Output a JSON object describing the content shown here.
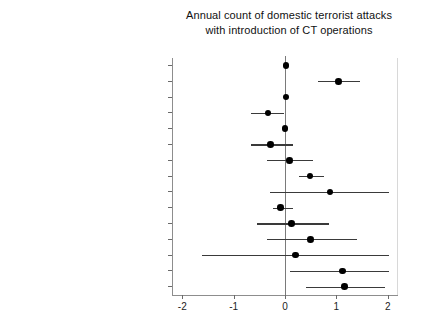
{
  "chart_data": {
    "type": "scatter",
    "title": "Annual count of domestic terrorist attacks with introduction of CT operations",
    "title_lines": [
      "Annual count of domestic terrorist attacks",
      "with introduction of CT operations"
    ],
    "subtitle": "",
    "xlabel": "",
    "ylabel": "",
    "xlim": [
      -2.2,
      2.2
    ],
    "xticks": [
      -2,
      -1,
      0,
      1,
      2
    ],
    "xtick_labels": [
      "-2",
      "-1",
      "0",
      "1",
      "2"
    ],
    "grid": false,
    "legend": "none",
    "reference_line": 0,
    "categories": [
      "Domestic terrorism (lagged)",
      "Introduction of CT operations (lagged)",
      "U.S. military assistance",
      "War on Terror year",
      "Polity IV score",
      "GDP",
      "Total population",
      "Military expenditures",
      "Excluded population (lagged)",
      "Total area",
      "MENA",
      "Africa",
      "Central Asia",
      "South Asia",
      "Southeast Asia"
    ],
    "series": [
      {
        "name": "Coefficient estimate",
        "point_color": "#000000",
        "line_color": "#3a3a3a",
        "points": [
          {
            "label": "Domestic terrorism (lagged)",
            "estimate": 0.02,
            "ci_low": 0.0,
            "ci_high": 0.04
          },
          {
            "label": "Introduction of CT operations (lagged)",
            "estimate": 1.04,
            "ci_low": 0.64,
            "ci_high": 1.47
          },
          {
            "label": "U.S. military assistance",
            "estimate": 0.02,
            "ci_low": -0.02,
            "ci_high": 0.06
          },
          {
            "label": "War on Terror year",
            "estimate": -0.33,
            "ci_low": -0.67,
            "ci_high": -0.01
          },
          {
            "label": "Polity IV score",
            "estimate": 0.0,
            "ci_low": -0.03,
            "ci_high": 0.03
          },
          {
            "label": "GDP",
            "estimate": -0.28,
            "ci_low": -0.67,
            "ci_high": 0.15
          },
          {
            "label": "Total population",
            "estimate": 0.09,
            "ci_low": -0.36,
            "ci_high": 0.55
          },
          {
            "label": "Military expenditures",
            "estimate": 0.49,
            "ci_low": 0.27,
            "ci_high": 0.76
          },
          {
            "label": "Excluded population (lagged)",
            "estimate": 0.88,
            "ci_low": -0.29,
            "ci_high": 2.02
          },
          {
            "label": "Total area",
            "estimate": -0.09,
            "ci_low": -0.24,
            "ci_high": 0.16
          },
          {
            "label": "MENA",
            "estimate": 0.13,
            "ci_low": -0.55,
            "ci_high": 0.85
          },
          {
            "label": "Africa",
            "estimate": 0.5,
            "ci_low": -0.36,
            "ci_high": 1.4
          },
          {
            "label": "Central Asia",
            "estimate": 0.21,
            "ci_low": -1.62,
            "ci_high": 2.02
          },
          {
            "label": "South Asia",
            "estimate": 1.12,
            "ci_low": 0.09,
            "ci_high": 2.02
          },
          {
            "label": "Southeast Asia",
            "estimate": 1.16,
            "ci_low": 0.4,
            "ci_high": 1.95
          }
        ]
      }
    ]
  }
}
